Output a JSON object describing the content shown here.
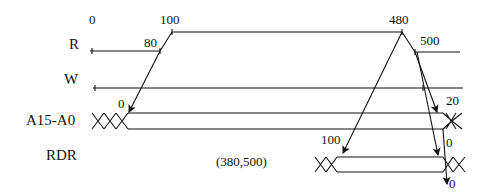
{
  "diagram": {
    "type": "timing-diagram",
    "signals": [
      {
        "name": "R",
        "label": "R"
      },
      {
        "name": "W",
        "label": "W"
      },
      {
        "name": "A15-A0",
        "label": "A15-A0"
      },
      {
        "name": "RDR",
        "label": "RDR"
      }
    ],
    "time_labels": {
      "t0": "0",
      "t100": "100",
      "t480": "480",
      "t500": "500",
      "t80": "80"
    },
    "delay_labels": {
      "addr_start": "0",
      "addr_end": "20",
      "rdr_start": "100",
      "rdr_end_1": "0",
      "rdr_end_2": "0"
    },
    "annotation": "(380,500)",
    "colors": {
      "line": "#111111",
      "background": "#ffffff"
    }
  }
}
